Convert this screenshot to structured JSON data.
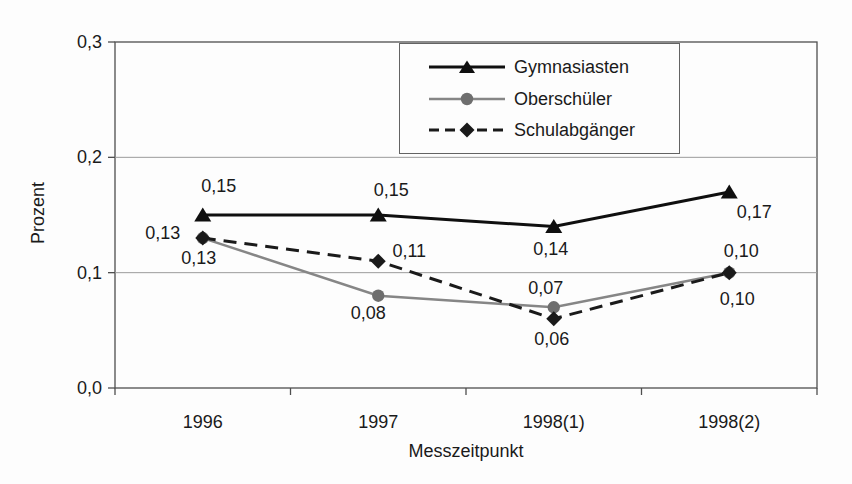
{
  "chart_data": {
    "type": "line",
    "title": "",
    "categories": [
      "1996",
      "1997",
      "1998(1)",
      "1998(2)"
    ],
    "xlabel": "Messzeitpunkt",
    "ylabel": "Prozent",
    "ylim": [
      0,
      0.3
    ],
    "yticks": [
      {
        "value": 0.0,
        "label": "0,0"
      },
      {
        "value": 0.1,
        "label": "0,1"
      },
      {
        "value": 0.2,
        "label": "0,2"
      },
      {
        "value": 0.3,
        "label": "0,3"
      }
    ],
    "grid": "horizontal",
    "legend_position": "top-right-inside",
    "series": [
      {
        "name": "Gymnasiasten",
        "values": [
          0.15,
          0.15,
          0.14,
          0.17
        ],
        "point_labels": [
          "0,15",
          "0,15",
          "0,14",
          "0,17"
        ],
        "line_style": "solid",
        "marker": "triangle",
        "color": "#0f0f0f",
        "marker_fill": "#0f0f0f",
        "label_offsets": [
          [
            16,
            -29
          ],
          [
            13,
            -25
          ],
          [
            -3,
            22
          ],
          [
            25,
            20
          ]
        ]
      },
      {
        "name": "Oberschüler",
        "values": [
          0.13,
          0.08,
          0.07,
          0.1
        ],
        "point_labels": [
          "0,13",
          "0,08",
          "0,07",
          "0,10"
        ],
        "line_style": "solid",
        "marker": "circle",
        "color": "#868686",
        "marker_fill": "#6e6e6e",
        "label_offsets": [
          [
            -4,
            20
          ],
          [
            -10,
            17
          ],
          [
            -8,
            -19
          ],
          [
            8,
            26
          ]
        ]
      },
      {
        "name": "Schulabgänger",
        "values": [
          0.13,
          0.11,
          0.06,
          0.1
        ],
        "point_labels": [
          "0,13",
          "0,11",
          "0,06",
          "0,10"
        ],
        "line_style": "dashed",
        "marker": "diamond",
        "color": "#1a1a1a",
        "marker_fill": "#1a1a1a",
        "label_offsets": [
          [
            -40,
            -5
          ],
          [
            31,
            -10
          ],
          [
            -2,
            20
          ],
          [
            12,
            -22
          ]
        ]
      }
    ]
  }
}
